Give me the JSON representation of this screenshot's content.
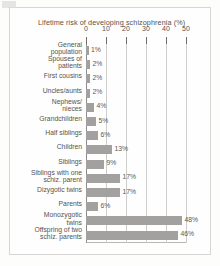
{
  "chart_data": {
    "type": "bar",
    "orientation": "horizontal",
    "title": "Lifetime risk of  developing schizophrenia (%)",
    "xlabel": "",
    "ylabel": "",
    "xlim": [
      0,
      50
    ],
    "xticks": [
      0,
      10,
      20,
      30,
      40,
      50
    ],
    "grid": true,
    "legend": false,
    "value_suffix": "%",
    "categories": [
      "General population",
      "Spouses of patients",
      "First cousins",
      "Uncles/aunts",
      "Nephews/ nieces",
      "Grandchildren",
      "Half siblings",
      "Children",
      "Siblings",
      "Siblings with one schiz. parent",
      "Dizygotic twins",
      "Parents",
      "Monozygotic twins",
      "Offspring of two schiz. parents"
    ],
    "values": [
      1,
      2,
      2,
      2,
      4,
      5,
      6,
      13,
      9,
      17,
      17,
      6,
      48,
      46
    ],
    "value_labels": [
      "1%",
      "2%",
      "2%",
      "2%",
      "4%",
      "5%",
      "6%",
      "13%",
      "9%",
      "17%",
      "17%",
      "6%",
      "48%",
      "46%"
    ],
    "category_lines": [
      [
        "General",
        "population"
      ],
      [
        "Spouses of",
        "patients"
      ],
      [
        "First cousins"
      ],
      [
        "Uncles/aunts"
      ],
      [
        "Nephews/",
        "nieces"
      ],
      [
        "Grandchildren"
      ],
      [
        "Half siblings"
      ],
      [
        "Children"
      ],
      [
        "Siblings"
      ],
      [
        "Siblings with one",
        "schiz. parent"
      ],
      [
        "Dizygotic twins"
      ],
      [
        "Parents"
      ],
      [
        "Monozygotic",
        "twins"
      ],
      [
        "Offspring of two",
        "schiz. parents"
      ]
    ],
    "bar_color": "#a3a1a0",
    "grid_color": "#cfcdc9",
    "axis_color": "#8e8c88",
    "text_color": "#55534f"
  }
}
